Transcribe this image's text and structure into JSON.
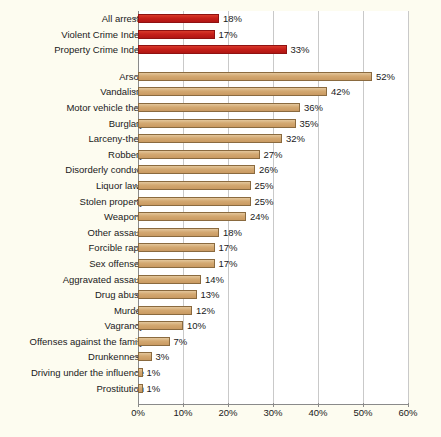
{
  "chart_data": {
    "type": "bar",
    "orientation": "horizontal",
    "title": "",
    "subtitle": "",
    "xlabel": "",
    "ylabel": "",
    "xlim": [
      0,
      60
    ],
    "xtick_labels": [
      "0%",
      "10%",
      "20%",
      "30%",
      "40%",
      "50%",
      "60%"
    ],
    "xtick_values": [
      0,
      10,
      20,
      30,
      40,
      50,
      60
    ],
    "grid": true,
    "legend": "none",
    "groups": [
      {
        "name": "summary-indices",
        "color": "#c61f1a",
        "categories": [
          "All arrests",
          "Violent Crime Index",
          "Property Crime Index"
        ],
        "values": [
          18,
          17,
          33
        ],
        "value_labels": [
          "18%",
          "17%",
          "33%"
        ]
      },
      {
        "name": "offense-breakdown",
        "color": "#d3a871",
        "categories": [
          "Arson",
          "Vandalism",
          "Motor vehicle theft",
          "Burglary",
          "Larceny-theft",
          "Robbery",
          "Disorderly conduct",
          "Liquor laws",
          "Stolen property",
          "Weapons",
          "Other assault",
          "Forcible rape",
          "Sex offenses",
          "Aggravated assault",
          "Drug abuse",
          "Murder",
          "Vagrancy",
          "Offenses against the family",
          "Drunkenness",
          "Driving under the influence",
          "Prostitution"
        ],
        "values": [
          52,
          42,
          36,
          35,
          32,
          27,
          26,
          25,
          25,
          24,
          18,
          17,
          17,
          14,
          13,
          12,
          10,
          7,
          3,
          1,
          1
        ],
        "value_labels": [
          "52%",
          "42%",
          "36%",
          "35%",
          "32%",
          "27%",
          "26%",
          "25%",
          "25%",
          "24%",
          "18%",
          "17%",
          "17%",
          "14%",
          "13%",
          "12%",
          "10%",
          "7%",
          "3%",
          "1%",
          "1%"
        ]
      }
    ]
  },
  "colors": {
    "background": "#fdfcf0",
    "plot_background": "#ffffff",
    "bar_red": "#c61f1a",
    "bar_tan": "#d3a871",
    "gridline": "#c9c9c9",
    "axis": "#8a8a8a",
    "text": "#1a1a1a"
  }
}
